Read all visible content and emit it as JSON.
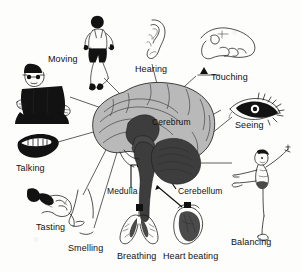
{
  "figure": {
    "type": "labelled-anatomy-diagram",
    "palette": {
      "background": "#fdfdfc",
      "ink": "#101010",
      "cortex_fill": "#b9b9b9",
      "deep_structure_fill": "#3d3d3d",
      "leader_line": "#1b1b1b"
    }
  },
  "brain_parts": [
    {
      "id": "cerebrum",
      "label": "Cerebrum"
    },
    {
      "id": "medulla",
      "label": "Medulla"
    },
    {
      "id": "cerebellum",
      "label": "Cerebellum"
    }
  ],
  "functions": [
    {
      "id": "moving",
      "label": "Moving",
      "icon": "running-man-icon"
    },
    {
      "id": "hearing",
      "label": "Hearing",
      "icon": "ear-icon"
    },
    {
      "id": "touching",
      "label": "Touching",
      "icon": "hand-touch-icon"
    },
    {
      "id": "thinking",
      "label": "Thinking",
      "icon": "person-reading-icon"
    },
    {
      "id": "seeing",
      "label": "Seeing",
      "icon": "eye-icon"
    },
    {
      "id": "talking",
      "label": "Talking",
      "icon": "mouth-icon"
    },
    {
      "id": "tasting",
      "label": "Tasting",
      "icon": "tongue-tasting-icon"
    },
    {
      "id": "smelling",
      "label": "Smelling",
      "icon": "nose-icon"
    },
    {
      "id": "breathing",
      "label": "Breathing",
      "icon": "lungs-icon"
    },
    {
      "id": "heart_beating",
      "label": "Heart beating",
      "icon": "heart-icon"
    },
    {
      "id": "balancing",
      "label": "Balancing",
      "icon": "balancing-skater-icon"
    }
  ]
}
